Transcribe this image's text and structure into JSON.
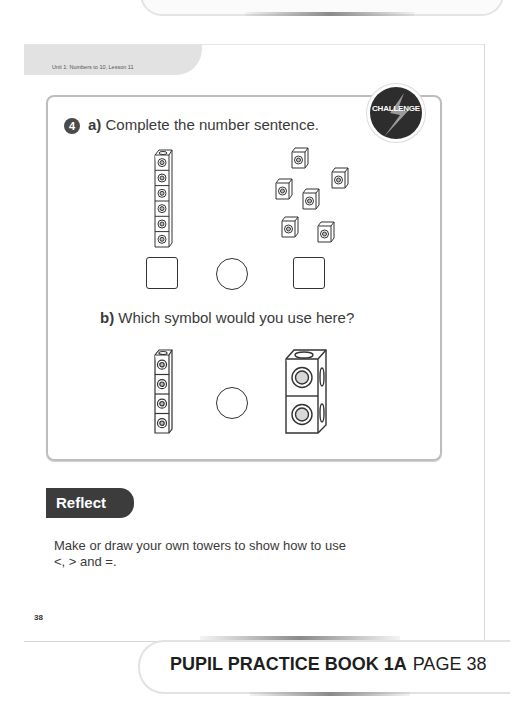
{
  "header": {
    "unit_label": "Unit 1: Numbers to 10, Lesson 11"
  },
  "question": {
    "number": "4",
    "badge": "CHALLENGE",
    "part_a": {
      "label": "a)",
      "text": "Complete the number sentence.",
      "left_tower_cubes": 6,
      "right_loose_cubes": 6
    },
    "part_b": {
      "label": "b)",
      "text": "Which symbol would you use here?",
      "left_tower_cubes": 4,
      "right_tower_cubes": 2,
      "right_tower_size": "large"
    }
  },
  "reflect": {
    "title": "Reflect",
    "text": "Make or draw your own towers to show how to use <, > and =."
  },
  "footer": {
    "page_number": "38",
    "caption_book": "PUPIL PRACTICE BOOK 1A",
    "caption_page": "PAGE 38"
  },
  "colors": {
    "badge_bg": "#2d2d2d",
    "reflect_bg": "#3c3c3c",
    "unit_tab_bg": "#e2e2e2",
    "box_border": "#bdbdbd"
  }
}
